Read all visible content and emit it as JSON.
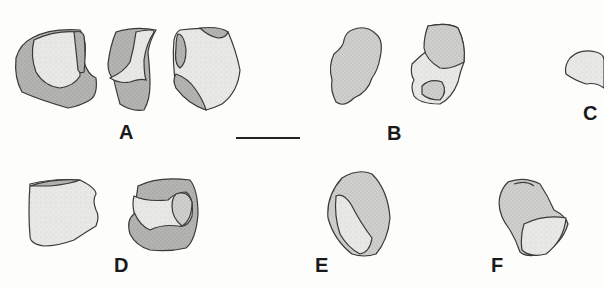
{
  "figure": {
    "panels": [
      {
        "id": "A",
        "label": "A",
        "views": 3
      },
      {
        "id": "B",
        "label": "B",
        "views": 2
      },
      {
        "id": "C",
        "label": "C",
        "views": 1
      },
      {
        "id": "D",
        "label": "D",
        "views": 2
      },
      {
        "id": "E",
        "label": "E",
        "views": 1
      },
      {
        "id": "F",
        "label": "F",
        "views": 1
      }
    ],
    "scale_bar": {
      "visible": true
    },
    "colors": {
      "outline": "#3a3a3a",
      "light_fill": "#e4e4e2",
      "dark_fill": "#a8a8a6",
      "background": "#fdfdfc",
      "label": "#1a1a1a"
    }
  }
}
